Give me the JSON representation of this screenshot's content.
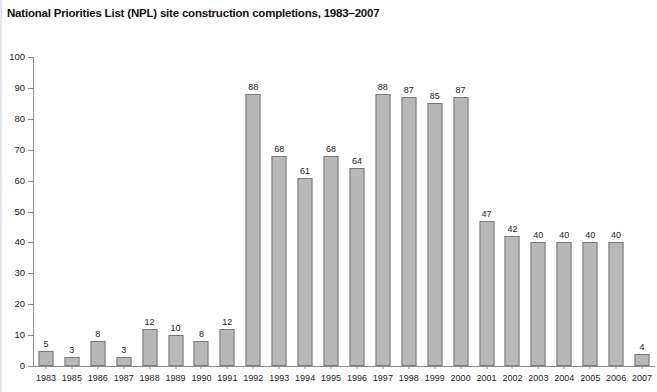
{
  "page": {
    "title": "National Priorities List (NPL) site construction completions, 1983–2007"
  },
  "chart_data": {
    "type": "bar",
    "title": "National Priorities List (NPL) site construction completions, 1983–2007",
    "xlabel": "",
    "ylabel": "",
    "ylim": [
      0,
      100
    ],
    "ytick_step": 10,
    "yticks": [
      0,
      10,
      20,
      30,
      40,
      50,
      60,
      70,
      80,
      90,
      100
    ],
    "grid": false,
    "legend": false,
    "show_value_labels": true,
    "bar_color": "#b8b8b8",
    "bar_border_color": "#7a7a7a",
    "axis_color": "#8c8c8c",
    "categories": [
      "1983",
      "1985",
      "1986",
      "1987",
      "1988",
      "1989",
      "1990",
      "1991",
      "1992",
      "1993",
      "1994",
      "1995",
      "1996",
      "1997",
      "1998",
      "1999",
      "2000",
      "2001",
      "2002",
      "2003",
      "2004",
      "2005",
      "2006",
      "2007"
    ],
    "values": [
      5,
      3,
      8,
      3,
      12,
      10,
      8,
      12,
      88,
      68,
      61,
      68,
      64,
      88,
      87,
      85,
      87,
      47,
      42,
      40,
      40,
      40,
      40,
      4
    ]
  }
}
